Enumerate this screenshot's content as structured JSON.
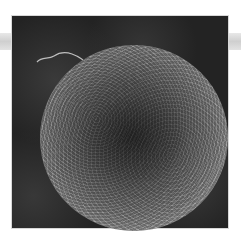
{
  "image": {
    "description": "Grayscale scanning electron micrograph of a rough spherical particle on a dark background",
    "subject": "spherical-particle",
    "colors": {
      "background": "#ffffff",
      "frame": "#232323",
      "sphere_rim": "#bdbdbd",
      "sphere_core": "#3a3a3a",
      "side_band": "#cfcfcf"
    }
  }
}
